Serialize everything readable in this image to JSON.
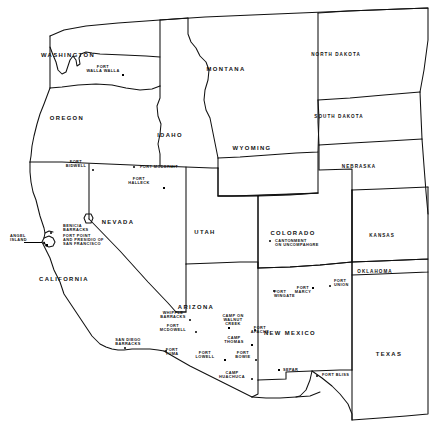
{
  "map": {
    "kind": "historical-map",
    "region": "Western United States",
    "subject": "Military forts, camps, barracks and posts",
    "background_color": "#ffffff",
    "ink_color": "#000000",
    "width": 430,
    "height": 448
  },
  "states": [
    {
      "name": "WASHINGTON",
      "x": 68,
      "y": 55,
      "size": "sm"
    },
    {
      "name": "OREGON",
      "x": 67,
      "y": 118,
      "size": "sm"
    },
    {
      "name": "IDAHO",
      "x": 170,
      "y": 135,
      "size": "sm"
    },
    {
      "name": "MONTANA",
      "x": 226,
      "y": 69,
      "size": "sm"
    },
    {
      "name": "NORTH DAKOTA",
      "x": 336,
      "y": 55,
      "size": "xs"
    },
    {
      "name": "SOUTH DAKOTA",
      "x": 339,
      "y": 117,
      "size": "xs"
    },
    {
      "name": "NEBRASKA",
      "x": 359,
      "y": 167,
      "size": "xs"
    },
    {
      "name": "WYOMING",
      "x": 252,
      "y": 148,
      "size": "sm"
    },
    {
      "name": "NEVADA",
      "x": 118,
      "y": 222,
      "size": "sm"
    },
    {
      "name": "UTAH",
      "x": 205,
      "y": 232,
      "size": "sm"
    },
    {
      "name": "COLORADO",
      "x": 293,
      "y": 233,
      "size": "sm"
    },
    {
      "name": "KANSAS",
      "x": 382,
      "y": 236,
      "size": "xs"
    },
    {
      "name": "OKLAHOMA",
      "x": 375,
      "y": 272,
      "size": "xs"
    },
    {
      "name": "CALIFORNIA",
      "x": 64,
      "y": 279,
      "size": "sm"
    },
    {
      "name": "ARIZONA",
      "x": 196,
      "y": 307,
      "size": "sm"
    },
    {
      "name": "NEW MEXICO",
      "x": 290,
      "y": 333,
      "size": "sm"
    },
    {
      "name": "TEXAS",
      "x": 389,
      "y": 354,
      "size": "sm"
    }
  ],
  "forts": [
    {
      "name": "FORT\nWALLA WALLA",
      "lx": 103,
      "ly": 69,
      "align": "center",
      "mx": 123,
      "my": 75
    },
    {
      "name": "FORT\nBIDWELL",
      "lx": 76,
      "ly": 164,
      "align": "center",
      "mx": 93,
      "my": 170
    },
    {
      "name": "FORT MCDERMIT",
      "lx": 140,
      "ly": 167,
      "align": "left",
      "mx": 134,
      "my": 167
    },
    {
      "name": "FORT\nHALLECK",
      "lx": 139,
      "ly": 181,
      "align": "center",
      "mx": 164,
      "my": 188
    },
    {
      "name": "BENICIA\nBARRACKS",
      "lx": 63,
      "ly": 228,
      "align": "left",
      "mx": 51,
      "my": 233
    },
    {
      "name": "ANGEL\nISLAND",
      "lx": 10,
      "ly": 238,
      "align": "left",
      "mx": 44,
      "my": 243
    },
    {
      "name": "FORT POINT\nAND PRESIDIO OF\nSAN FRANCISCO",
      "lx": 63,
      "ly": 240,
      "align": "left",
      "mx": 47,
      "my": 245
    },
    {
      "name": "CANTONMENT\nON UNCOMPAHGRE",
      "lx": 275,
      "ly": 243,
      "align": "left",
      "mx": 270,
      "my": 241
    },
    {
      "name": "FORT\nWINGATE",
      "lx": 274,
      "ly": 294,
      "align": "left",
      "mx": 274,
      "my": 291
    },
    {
      "name": "FORT\nMARCY",
      "lx": 303,
      "ly": 290,
      "align": "center",
      "mx": 313,
      "my": 288
    },
    {
      "name": "FORT\nUNION",
      "lx": 334,
      "ly": 283,
      "align": "left",
      "mx": 330,
      "my": 286
    },
    {
      "name": "WHIPPLE\nBARRACKS",
      "lx": 173,
      "ly": 315,
      "align": "center",
      "mx": 190,
      "my": 320
    },
    {
      "name": "CAMP ON\nWALNUT\nCREEK",
      "lx": 233,
      "ly": 320,
      "align": "center",
      "mx": 229,
      "my": 328
    },
    {
      "name": "FORT\nAPACHE",
      "lx": 260,
      "ly": 330,
      "align": "center",
      "mx": 255,
      "my": 330
    },
    {
      "name": "FORT\nMCDOWELL",
      "lx": 173,
      "ly": 328,
      "align": "center",
      "mx": 196,
      "my": 332
    },
    {
      "name": "CAMP\nTHOMAS",
      "lx": 234,
      "ly": 340,
      "align": "center",
      "mx": 252,
      "my": 345
    },
    {
      "name": "SAN DIEGO\nBARRACKS",
      "lx": 128,
      "ly": 342,
      "align": "center",
      "mx": 125,
      "my": 348
    },
    {
      "name": "FORT\nYUMA",
      "lx": 172,
      "ly": 352,
      "align": "center",
      "mx": 166,
      "my": 351
    },
    {
      "name": "FORT\nLOWELL",
      "lx": 205,
      "ly": 355,
      "align": "center",
      "mx": 225,
      "my": 360
    },
    {
      "name": "FORT\nBOWIE",
      "lx": 243,
      "ly": 355,
      "align": "center",
      "mx": 256,
      "my": 360
    },
    {
      "name": "CAMP\nHUACHUCA",
      "lx": 232,
      "ly": 375,
      "align": "center",
      "mx": 252,
      "my": 379
    },
    {
      "name": "SEPAR",
      "lx": 283,
      "ly": 370,
      "align": "left",
      "mx": 279,
      "my": 370
    },
    {
      "name": "FORT BLISS",
      "lx": 322,
      "ly": 375,
      "align": "left",
      "mx": 317,
      "my": 376
    }
  ],
  "leaders": [
    {
      "x": 24,
      "y": 242,
      "w": 18
    }
  ]
}
